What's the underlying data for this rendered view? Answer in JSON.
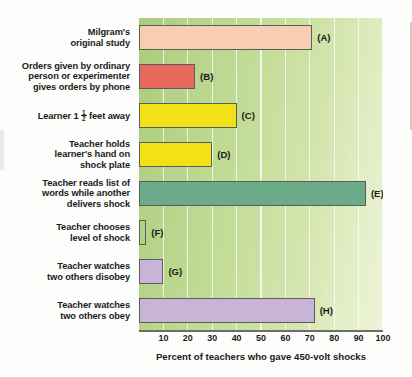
{
  "chart_data": {
    "type": "bar",
    "orientation": "horizontal",
    "title": "",
    "xlabel": "Percent of teachers who gave 450-volt shocks",
    "ylabel": "",
    "xlim": [
      0,
      100
    ],
    "xticks": [
      10,
      20,
      30,
      40,
      50,
      60,
      70,
      80,
      90,
      100
    ],
    "grid": true,
    "legend": "none",
    "categories": [
      "Milgram's original study",
      "Orders given by ordinary person or experimenter gives orders by phone",
      "Learner 1 1/2 feet away",
      "Teacher holds learner's hand on shock plate",
      "Teacher reads list of words while another delivers shock",
      "Teacher chooses level of shock",
      "Teacher watches two others disobey",
      "Teacher watches two others obey"
    ],
    "values": [
      71,
      23,
      40,
      30,
      93,
      3,
      10,
      72
    ],
    "point_labels": [
      "(A)",
      "(B)",
      "(C)",
      "(D)",
      "(E)",
      "(F)",
      "(G)",
      "(H)"
    ],
    "colors": [
      "#f8cdb4",
      "#e7685d",
      "#f2e117",
      "#f2e117",
      "#6cab8a",
      "#b3d08a",
      "#c7b4d7",
      "#c7b4d7"
    ]
  },
  "chart": {
    "xlabel": "Percent of teachers who gave 450-volt shocks",
    "bars": [
      {
        "letter": "(A)",
        "value": 71,
        "color": "#f8cdb4",
        "label_lines": [
          "Milgram's",
          "original study"
        ]
      },
      {
        "letter": "(B)",
        "value": 23,
        "color": "#e7685d",
        "label_lines": [
          "Orders given by ordinary",
          "person or experimenter",
          "gives orders by phone"
        ]
      },
      {
        "letter": "(C)",
        "value": 40,
        "color": "#f2e117",
        "label_lines": [
          "Learner 1 feet away"
        ],
        "has_fraction": true,
        "fraction_prefix": "Learner 1",
        "fraction_num": "1",
        "fraction_den": "2",
        "fraction_suffix": "feet away"
      },
      {
        "letter": "(D)",
        "value": 30,
        "color": "#f2e117",
        "label_lines": [
          "Teacher holds",
          "learner's hand on",
          "shock plate"
        ]
      },
      {
        "letter": "(E)",
        "value": 93,
        "color": "#6cab8a",
        "label_lines": [
          "Teacher reads list of",
          "words while another",
          "delivers shock"
        ]
      },
      {
        "letter": "(F)",
        "value": 3,
        "color": "#b3d08a",
        "label_lines": [
          "Teacher chooses",
          "level of shock"
        ]
      },
      {
        "letter": "(G)",
        "value": 10,
        "color": "#c7b4d7",
        "label_lines": [
          "Teacher watches",
          "two others disobey"
        ]
      },
      {
        "letter": "(H)",
        "value": 72,
        "color": "#c7b4d7",
        "label_lines": [
          "Teacher watches",
          "two others obey"
        ]
      }
    ],
    "xticks": [
      "10",
      "20",
      "30",
      "40",
      "50",
      "60",
      "70",
      "80",
      "90",
      "100"
    ]
  }
}
